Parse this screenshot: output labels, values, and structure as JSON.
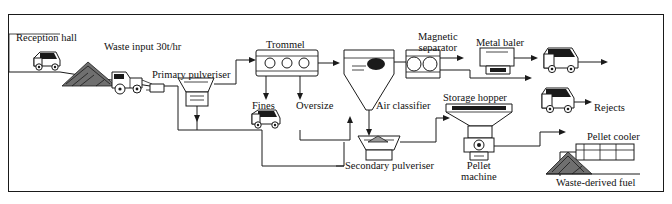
{
  "diagram": {
    "title_absent": true,
    "border_color": "#1a1a1a",
    "background": "#ffffff",
    "labels": [
      {
        "id": "reception-hall",
        "text": "Reception hall",
        "x": 16,
        "y": 32,
        "size": 10.5
      },
      {
        "id": "waste-input",
        "text": "Waste input 30t/hr",
        "x": 104,
        "y": 41,
        "size": 10.5
      },
      {
        "id": "primary-pulveriser",
        "text": "Primary pulveriser",
        "x": 152,
        "y": 69,
        "size": 10.5
      },
      {
        "id": "trommel",
        "text": "Trommel",
        "x": 266,
        "y": 39,
        "size": 10.5
      },
      {
        "id": "fines",
        "text": "Fines",
        "x": 252,
        "y": 100,
        "size": 10.5
      },
      {
        "id": "oversize",
        "text": "Oversize",
        "x": 296,
        "y": 100,
        "size": 10.5
      },
      {
        "id": "air-classifier",
        "text": "Air classifier",
        "x": 376,
        "y": 100,
        "size": 10.5
      },
      {
        "id": "magnetic-separator",
        "text": "Magnetic\nseparator",
        "x": 418,
        "y": 31,
        "size": 10.5
      },
      {
        "id": "metal-baler",
        "text": "Metal baler",
        "x": 476,
        "y": 37,
        "size": 10.5
      },
      {
        "id": "storage-hopper",
        "text": "Storage hopper",
        "x": 443,
        "y": 92,
        "size": 10.5
      },
      {
        "id": "rejects",
        "text": "Rejects",
        "x": 594,
        "y": 102,
        "size": 10.5
      },
      {
        "id": "pellet-cooler",
        "text": "Pellet cooler",
        "x": 587,
        "y": 138,
        "size": 10.5
      },
      {
        "id": "pellet-machine",
        "text": "Pellet\nmachine",
        "x": 463,
        "y": 152,
        "size": 10.5
      },
      {
        "id": "secondary-pulveriser",
        "text": "Secondary pulveriser",
        "x": 345,
        "y": 160,
        "size": 10.5
      },
      {
        "id": "waste-derived-fuel",
        "text": "Waste-derived fuel",
        "x": 556,
        "y": 177,
        "size": 10.5
      }
    ],
    "nodes": [
      {
        "id": "truck-reception",
        "label": "tipper truck at reception hall"
      },
      {
        "id": "loader",
        "label": "front-end loader"
      },
      {
        "id": "waste-pile",
        "label": "waste pile"
      },
      {
        "id": "primary-pulveriser-unit",
        "label": "primary pulveriser hopper"
      },
      {
        "id": "trommel-unit",
        "label": "rotating trommel screen"
      },
      {
        "id": "fines-truck",
        "label": "fines collection truck"
      },
      {
        "id": "air-classifier-unit",
        "label": "air classifier cyclone"
      },
      {
        "id": "magnetic-separator-unit",
        "label": "magnetic separator drum"
      },
      {
        "id": "metal-baler-unit",
        "label": "metal baler press"
      },
      {
        "id": "baled-metal-truck",
        "label": "truck for baled metal"
      },
      {
        "id": "rejects-truck",
        "label": "rejects truck"
      },
      {
        "id": "storage-hopper-unit",
        "label": "storage hopper"
      },
      {
        "id": "pellet-machine-unit",
        "label": "pellet machine"
      },
      {
        "id": "secondary-pulveriser-unit",
        "label": "secondary pulveriser"
      },
      {
        "id": "pellet-cooler-unit",
        "label": "pellet cooler"
      },
      {
        "id": "fuel-pile",
        "label": "waste-derived fuel pile"
      }
    ]
  }
}
